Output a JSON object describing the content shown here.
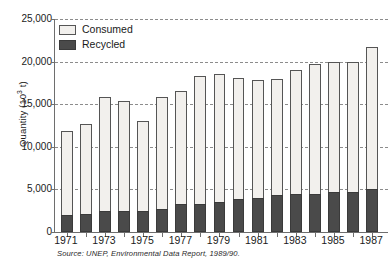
{
  "chart_data": {
    "type": "bar",
    "subtype": "stacked-vertical",
    "title": "",
    "xlabel": "",
    "ylabel": "Quantity (10",
    "ylabel_sup": "3",
    "ylabel_tail": " t)",
    "ylim": [
      0,
      25000
    ],
    "ytick_values": [
      0,
      5000,
      10000,
      15000,
      20000,
      25000
    ],
    "ytick_labels": [
      "0",
      "5,000",
      "10,000",
      "15,000",
      "20,000",
      "25,000"
    ],
    "grid": true,
    "grid_style": "dashed-horizontal",
    "legend_position": "top-left",
    "categories": [
      "1971",
      "1972",
      "1973",
      "1974",
      "1975",
      "1976",
      "1977",
      "1978",
      "1979",
      "1980",
      "1981",
      "1982",
      "1983",
      "1984",
      "1985",
      "1986",
      "1987"
    ],
    "xtick_labels_shown": [
      "1971",
      "1973",
      "1975",
      "1977",
      "1979",
      "1981",
      "1983",
      "1985",
      "1987"
    ],
    "series": [
      {
        "name": "Consumed",
        "color": "#f2f0ed",
        "note": "Total stack height (consumed total, including recycled portion)",
        "values": [
          11800,
          12700,
          15800,
          15400,
          13000,
          15800,
          16600,
          18300,
          18600,
          18100,
          17800,
          18000,
          19000,
          19700,
          20000,
          20000,
          21700
        ]
      },
      {
        "name": "Recycled",
        "color": "#4a4a4a",
        "values": [
          1950,
          2150,
          2500,
          2500,
          2500,
          2750,
          3250,
          3300,
          3500,
          3900,
          4000,
          4350,
          4500,
          4500,
          4700,
          4700,
          5100
        ]
      }
    ],
    "source": "Source: UNEP, Environmental Data Report, 1989/90."
  },
  "legend": {
    "items": [
      {
        "label": "Consumed",
        "swatch": "light-square-swatch"
      },
      {
        "label": "Recycled",
        "swatch": "dark-square-swatch"
      }
    ]
  }
}
